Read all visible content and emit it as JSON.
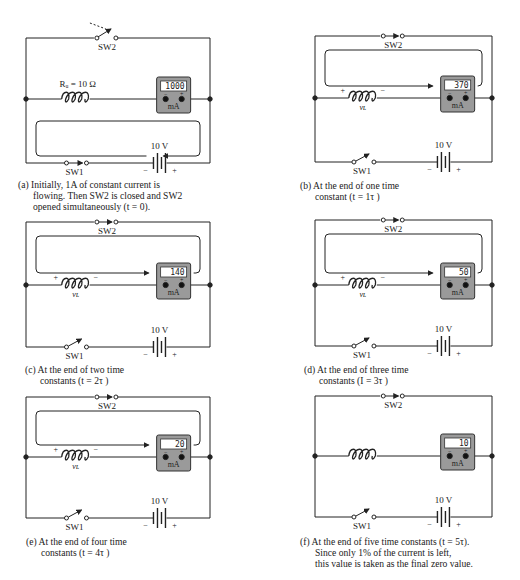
{
  "figure": {
    "source_voltage": "10 V",
    "switch_labels": {
      "top": "SW2",
      "bottom": "SW1"
    },
    "meter_unit": "mA",
    "meter_terminals": [
      "−",
      "+"
    ],
    "inductor_polarity": [
      "+",
      "−"
    ],
    "inductor_voltage_label": "v_L",
    "resistance_label": "R_W = 10 Ω",
    "battery_polarity": [
      "−",
      "+"
    ]
  },
  "panels": [
    {
      "id": "a",
      "meter_reading": "1000",
      "sw1_state": "closed",
      "sw2_state": "closing",
      "show_vl": false,
      "show_rw": true,
      "caption": [
        "(a) Initially, 1A of constant current is",
        "flowing. Then SW2 is closed and SW2",
        "opened simultaneously (t = 0)."
      ]
    },
    {
      "id": "b",
      "meter_reading": "370",
      "sw1_state": "open",
      "sw2_state": "closed",
      "show_vl": true,
      "caption": [
        "(b) At the end of one time",
        "constant (t = 1τ )"
      ]
    },
    {
      "id": "c",
      "meter_reading": "140",
      "sw1_state": "open",
      "sw2_state": "closed",
      "show_vl": true,
      "caption": [
        "(c) At the end of two time",
        "constants (t = 2τ )"
      ]
    },
    {
      "id": "d",
      "meter_reading": "50",
      "sw1_state": "open",
      "sw2_state": "closed",
      "show_vl": true,
      "caption": [
        "(d) At the end of three time",
        "constants (I = 3τ )"
      ]
    },
    {
      "id": "e",
      "meter_reading": "20",
      "sw1_state": "open",
      "sw2_state": "closed",
      "show_vl": true,
      "caption": [
        "(e) At the end of four time",
        "constants (t = 4τ )"
      ]
    },
    {
      "id": "f",
      "meter_reading": "10",
      "sw1_state": "open",
      "sw2_state": "closed",
      "show_vl": false,
      "caption": [
        "(f) At the end of five time constants (t = 5τ).",
        "Since only 1% of the current is left,",
        "this value is taken as the final zero value."
      ]
    }
  ],
  "chart_data": {
    "type": "line",
    "xlabel": "Time (time constants τ)",
    "ylabel": "Current (mA)",
    "x": [
      0,
      1,
      2,
      3,
      4,
      5
    ],
    "categories": [
      "t = 0",
      "t = 1τ",
      "t = 2τ",
      "t = 3τ",
      "t = 4τ",
      "t = 5τ"
    ],
    "series": [
      {
        "name": "Meter reading (mA)",
        "values": [
          1000,
          370,
          140,
          50,
          20,
          10
        ]
      }
    ],
    "ylim": [
      0,
      1000
    ]
  }
}
